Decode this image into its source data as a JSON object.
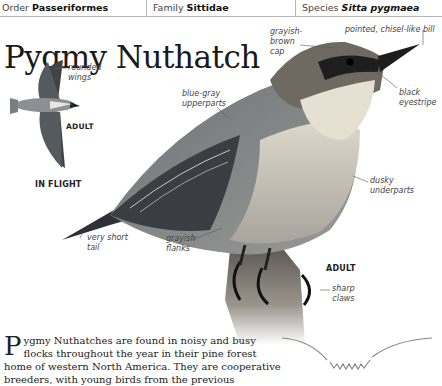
{
  "header": {
    "order_label": "Order",
    "order_value": "Passeriformes",
    "family_label": "Family",
    "family_value": "Sittidae",
    "species_label": "Species",
    "species_value": "Sitta pygmaea"
  },
  "title": "Pygmy Nuthatch",
  "flight_illustration": {
    "wing_label_1": "rounded",
    "wing_label_2": "wings",
    "age_label": "ADULT",
    "caption": "IN FLIGHT"
  },
  "main_illustration": {
    "labels": {
      "cap_1": "grayish-",
      "cap_2": "brown",
      "cap_3": "cap",
      "bill": "pointed, chisel-like bill",
      "upperparts_1": "blue-gray",
      "upperparts_2": "upperparts",
      "eyestripe_1": "black",
      "eyestripe_2": "eyestripe",
      "underparts_1": "dusky",
      "underparts_2": "underparts",
      "tail_1": "very short",
      "tail_2": "tail",
      "flanks_1": "grayish",
      "flanks_2": "flanks",
      "claws_1": "sharp",
      "claws_2": "claws"
    },
    "age_label": "ADULT"
  },
  "description": {
    "dropcap": "P",
    "text": "ygmy Nuthatches are found in noisy and busy flocks throughout the year in their pine forest home of western North America. They are cooperative breeders, with young birds from the previous"
  }
}
